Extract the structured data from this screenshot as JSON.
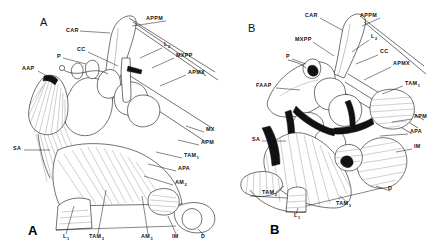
{
  "figure": {
    "type": "anatomical-line-drawing",
    "background_color": "#ffffff",
    "ink_color": "#111111"
  },
  "panels": [
    {
      "id": "A",
      "letter_top": "A",
      "letter_bottom": "A",
      "labels": [
        {
          "text": "CAR",
          "sub": "",
          "x": 66,
          "y": 32
        },
        {
          "text": "APPM",
          "sub": "",
          "x": 146,
          "y": 20
        },
        {
          "text": "CC",
          "sub": "",
          "x": 77,
          "y": 51
        },
        {
          "text": "P",
          "sub": "",
          "x": 57,
          "y": 58
        },
        {
          "text": "L",
          "sub": "2",
          "x": 164,
          "y": 46
        },
        {
          "text": "MXPP",
          "sub": "",
          "x": 176,
          "y": 57
        },
        {
          "text": "APMX",
          "sub": "",
          "x": 188,
          "y": 74
        },
        {
          "text": "AAP",
          "sub": "",
          "x": 22,
          "y": 70
        },
        {
          "text": "SA",
          "sub": "",
          "x": 13,
          "y": 150
        },
        {
          "text": "MX",
          "sub": "",
          "x": 206,
          "y": 131
        },
        {
          "text": "APM",
          "sub": "",
          "x": 201,
          "y": 144
        },
        {
          "text": "TAM",
          "sub": "1",
          "x": 184,
          "y": 157
        },
        {
          "text": "APA",
          "sub": "",
          "x": 178,
          "y": 170
        },
        {
          "text": "AM",
          "sub": "2",
          "x": 175,
          "y": 184
        },
        {
          "text": "L",
          "sub": "1",
          "x": 63,
          "y": 238
        },
        {
          "text": "TAM",
          "sub": "3",
          "x": 89,
          "y": 238
        },
        {
          "text": "AM",
          "sub": "3",
          "x": 141,
          "y": 238
        },
        {
          "text": "IM",
          "sub": "",
          "x": 172,
          "y": 238
        },
        {
          "text": "D",
          "sub": "",
          "x": 201,
          "y": 238
        }
      ]
    },
    {
      "id": "B",
      "letter_top": "B",
      "letter_bottom": "B",
      "labels": [
        {
          "text": "CAR",
          "sub": "",
          "x": 305,
          "y": 17
        },
        {
          "text": "APPM",
          "sub": "",
          "x": 360,
          "y": 17
        },
        {
          "text": "MXPP",
          "sub": "",
          "x": 295,
          "y": 41
        },
        {
          "text": "L",
          "sub": "2",
          "x": 371,
          "y": 38
        },
        {
          "text": "CC",
          "sub": "",
          "x": 380,
          "y": 53
        },
        {
          "text": "P",
          "sub": "",
          "x": 286,
          "y": 58
        },
        {
          "text": "APMX",
          "sub": "",
          "x": 393,
          "y": 65
        },
        {
          "text": "FAAP",
          "sub": "",
          "x": 256,
          "y": 87
        },
        {
          "text": "TAM",
          "sub": "1",
          "x": 405,
          "y": 85
        },
        {
          "text": "APM",
          "sub": "",
          "x": 414,
          "y": 118
        },
        {
          "text": "APA",
          "sub": "",
          "x": 410,
          "y": 133
        },
        {
          "text": "SA",
          "sub": "",
          "x": 252,
          "y": 141
        },
        {
          "text": "IM",
          "sub": "",
          "x": 414,
          "y": 148
        },
        {
          "text": "D",
          "sub": "",
          "x": 388,
          "y": 190
        },
        {
          "text": "TAM",
          "sub": "2",
          "x": 262,
          "y": 194
        },
        {
          "text": "TAM",
          "sub": "3",
          "x": 336,
          "y": 205
        },
        {
          "text": "L",
          "sub": "1",
          "x": 294,
          "y": 217
        }
      ]
    }
  ],
  "legend_keys": {
    "CAR": "carapace",
    "APPM": "anterior paragnath muscle apodeme",
    "CC": "cervical connective",
    "P": "paragnath",
    "L1": "labrum 1",
    "L2": "labrum 2",
    "MXPP": "maxillary palp",
    "APMX": "apodeme maxilla",
    "AAP": "anterior arthrodial process",
    "FAAP": "fan anterior arthrodial process",
    "SA": "sternal apodeme",
    "MX": "maxilla",
    "APM": "apodeme mandible",
    "TAM1": "transverse adductor muscle 1",
    "TAM2": "transverse adductor muscle 2",
    "TAM3": "transverse adductor muscle 3",
    "APA": "apodeme anterior",
    "AM2": "adductor muscle 2",
    "AM3": "adductor muscle 3",
    "IM": "intrinsic muscle",
    "D": "dactyl"
  }
}
